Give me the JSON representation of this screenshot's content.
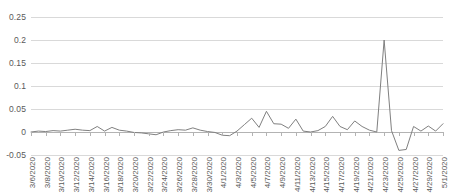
{
  "chart_data": {
    "type": "line",
    "title": "",
    "xlabel": "",
    "ylabel": "",
    "ylim": [
      -0.05,
      0.25
    ],
    "ytick_labels": [
      "0.25",
      "0.2",
      "0.15",
      "0.1",
      "0.05",
      "0",
      "-0.05"
    ],
    "yticks": [
      0.25,
      0.2,
      0.15,
      0.1,
      0.05,
      0,
      -0.05
    ],
    "grid": true,
    "legend": "none",
    "series_color": "#808080",
    "gridline_color": "#d9d9d9",
    "axis_color": "#b3b3b3",
    "label_color": "#595959",
    "x_tick_interval_days": 2,
    "categories": [
      "3/6/2020",
      "3/7/2020",
      "3/8/2020",
      "3/9/2020",
      "3/10/2020",
      "3/11/2020",
      "3/12/2020",
      "3/13/2020",
      "3/14/2020",
      "3/15/2020",
      "3/16/2020",
      "3/17/2020",
      "3/18/2020",
      "3/19/2020",
      "3/20/2020",
      "3/21/2020",
      "3/22/2020",
      "3/23/2020",
      "3/24/2020",
      "3/25/2020",
      "3/26/2020",
      "3/27/2020",
      "3/28/2020",
      "3/29/2020",
      "3/30/2020",
      "3/31/2020",
      "4/1/2020",
      "4/2/2020",
      "4/3/2020",
      "4/4/2020",
      "4/5/2020",
      "4/6/2020",
      "4/7/2020",
      "4/8/2020",
      "4/9/2020",
      "4/10/2020",
      "4/11/2020",
      "4/12/2020",
      "4/13/2020",
      "4/14/2020",
      "4/15/2020",
      "4/16/2020",
      "4/17/2020",
      "4/18/2020",
      "4/19/2020",
      "4/20/2020",
      "4/21/2020",
      "4/22/2020",
      "4/23/2020",
      "4/24/2020",
      "4/25/2020",
      "4/26/2020",
      "4/27/2020",
      "4/28/2020",
      "4/29/2020",
      "4/30/2020",
      "5/1/2020"
    ],
    "tick_labels": [
      "3/6/2020",
      "3/8/2020",
      "3/10/2020",
      "3/12/2020",
      "3/14/2020",
      "3/16/2020",
      "3/18/2020",
      "3/20/2020",
      "3/22/2020",
      "3/24/2020",
      "3/26/2020",
      "3/28/2020",
      "3/30/2020",
      "4/1/2020",
      "4/3/2020",
      "4/5/2020",
      "4/7/2020",
      "4/9/2020",
      "4/11/2020",
      "4/13/2020",
      "4/15/2020",
      "4/17/2020",
      "4/19/2020",
      "4/21/2020",
      "4/23/2020",
      "4/25/2020",
      "4/27/2020",
      "4/29/2020",
      "5/1/2020"
    ],
    "values": [
      0.0,
      0.002,
      0.001,
      0.003,
      0.002,
      0.004,
      0.006,
      0.004,
      0.003,
      0.012,
      0.002,
      0.01,
      0.004,
      0.002,
      -0.001,
      -0.002,
      -0.004,
      -0.006,
      0.0,
      0.003,
      0.005,
      0.004,
      0.009,
      0.004,
      0.001,
      -0.001,
      -0.007,
      -0.008,
      0.002,
      0.016,
      0.03,
      0.01,
      0.045,
      0.018,
      0.017,
      0.008,
      0.028,
      0.002,
      0.0,
      0.003,
      0.012,
      0.034,
      0.012,
      0.005,
      0.024,
      0.012,
      0.004,
      0.0,
      0.2,
      0.003,
      -0.04,
      -0.038,
      0.012,
      0.002,
      0.013,
      0.002,
      0.018
    ]
  }
}
